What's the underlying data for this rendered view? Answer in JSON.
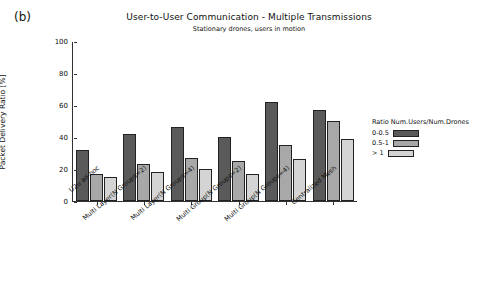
{
  "panel": {
    "label": "(b)"
  },
  "chart_data": {
    "type": "bar",
    "title": "User-to-User Communication - Multiple Transmissions",
    "subtitle": "Stationary drones, users in motion",
    "xlabel": "",
    "ylabel": "Packet Delivery Ratio [%]",
    "ylim": [
      0,
      100
    ],
    "yticks": [
      0,
      20,
      40,
      60,
      80,
      100
    ],
    "grid": false,
    "legend": {
      "title": "Ratio Num.Users/Num.Drones",
      "position": "right",
      "entries": [
        {
          "label": "0-0.5",
          "color": "#5a5a5a"
        },
        {
          "label": "0.5-1",
          "color": "#a8a8a8"
        },
        {
          "label": "> 1",
          "color": "#d4d4d4"
        }
      ]
    },
    "categories": [
      "U2u ad-hoc",
      "Multi Layer(N Groups=2)",
      "Multi Layer(N Groups=4)",
      "Multi Group(N Groups=2)",
      "Multi Group(N Groups=4)",
      "Centralized Mesh"
    ],
    "series": [
      {
        "name": "0-0.5",
        "color": "#5a5a5a",
        "values": [
          32,
          42,
          46,
          40,
          62,
          57
        ]
      },
      {
        "name": "0.5-1",
        "color": "#a8a8a8",
        "values": [
          17,
          23,
          27,
          25,
          35,
          50
        ]
      },
      {
        "name": "> 1",
        "color": "#d4d4d4",
        "values": [
          15,
          18,
          20,
          17,
          26,
          39
        ]
      }
    ]
  }
}
